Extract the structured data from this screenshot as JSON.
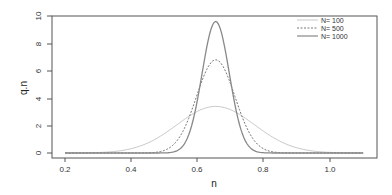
{
  "chart_data": {
    "type": "line",
    "title": "",
    "xlabel": "n",
    "ylabel": "q.n",
    "xlim": [
      0.2,
      1.1
    ],
    "ylim": [
      0,
      10
    ],
    "x_ticks": [
      "0.2",
      "0.4",
      "0.6",
      "0.8",
      "1.0"
    ],
    "y_ticks": [
      "0",
      "2",
      "4",
      "6",
      "8",
      "10"
    ],
    "grid": false,
    "legend_position": "top-right",
    "series": [
      {
        "name": "N= 100",
        "style": "solid-light",
        "color": "#c8c8c8",
        "mean": 0.655,
        "sd": 0.117,
        "peak": 3.4
      },
      {
        "name": "N= 500",
        "style": "dashed",
        "color": "#777777",
        "mean": 0.655,
        "sd": 0.058,
        "peak": 6.8
      },
      {
        "name": "N= 1000",
        "style": "solid",
        "color": "#888888",
        "mean": 0.655,
        "sd": 0.041,
        "peak": 9.6
      }
    ],
    "x": [
      0.2,
      0.3,
      0.4,
      0.5,
      0.55,
      0.6,
      0.65,
      0.7,
      0.75,
      0.8,
      0.9,
      1.0,
      1.1
    ],
    "values_note": "density curves sampled at x",
    "series_values": {
      "N= 100": [
        0.02,
        0.09,
        0.33,
        1.4,
        2.3,
        3.0,
        3.4,
        3.1,
        2.4,
        1.6,
        0.5,
        0.1,
        0.01
      ],
      "N= 500": [
        0.0,
        0.0,
        0.0,
        0.2,
        1.3,
        4.1,
        6.8,
        5.4,
        1.8,
        0.3,
        0.0,
        0.0,
        0.0
      ],
      "N= 1000": [
        0.0,
        0.0,
        0.0,
        0.0,
        0.3,
        4.0,
        9.6,
        4.9,
        0.6,
        0.0,
        0.0,
        0.0,
        0.0
      ]
    }
  },
  "legend": {
    "items": [
      {
        "label": "N= 100"
      },
      {
        "label": "N= 500"
      },
      {
        "label": "N= 1000"
      }
    ]
  },
  "axes": {
    "xlabel": "n",
    "ylabel": "q.n",
    "x_ticks": [
      "0.2",
      "0.4",
      "0.6",
      "0.8",
      "1.0"
    ],
    "y_ticks": [
      "0",
      "2",
      "4",
      "6",
      "8",
      "10"
    ]
  }
}
